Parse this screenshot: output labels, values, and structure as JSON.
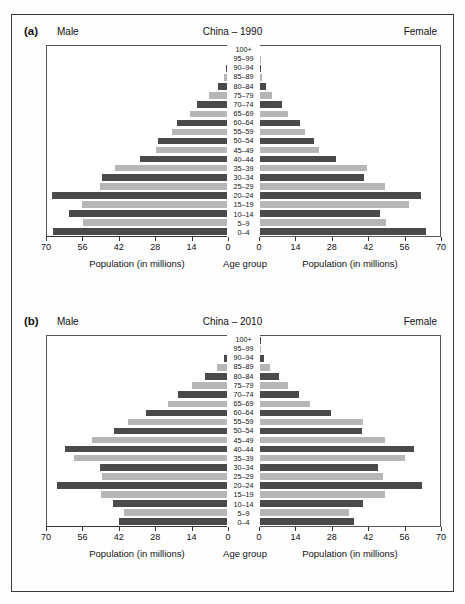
{
  "figure": {
    "panels": [
      {
        "tag": "(a)",
        "title": "China – 1990",
        "male_header": "Male",
        "female_header": "Female",
        "left_axis_title": "Population (in millions)",
        "center_axis_title": "Age group",
        "right_axis_title": "Population (in millions)"
      },
      {
        "tag": "(b)",
        "title": "China – 2010",
        "male_header": "Male",
        "female_header": "Female",
        "left_axis_title": "Population (in millions)",
        "center_axis_title": "Age group",
        "right_axis_title": "Population (in millions)"
      }
    ]
  },
  "colors": {
    "bar_dark": "#4a4a4a",
    "bar_light": "#b6b6b6",
    "frame": "#3a3a3a",
    "text": "#111111"
  },
  "chart_data": [
    {
      "type": "bar",
      "title": "China – 1990",
      "subtitle": "(a)",
      "orientation": "horizontal",
      "layout": "population-pyramid",
      "xlabel": "Population (in millions)",
      "ylabel": "Age group",
      "left_label": "Male",
      "right_label": "Female",
      "xlim": [
        0,
        70
      ],
      "xticks": [
        0,
        14,
        28,
        42,
        56,
        70
      ],
      "left_xticks_order": [
        70,
        56,
        42,
        28,
        14,
        0
      ],
      "right_xticks_order": [
        0,
        14,
        28,
        42,
        56,
        70
      ],
      "grid": false,
      "legend": "none",
      "categories": [
        "0–4",
        "5–9",
        "10–14",
        "15–19",
        "20–24",
        "25–29",
        "30–34",
        "35–39",
        "40–44",
        "45–49",
        "50–54",
        "55–59",
        "60–64",
        "65–69",
        "70–74",
        "75–79",
        "80–84",
        "85–89",
        "90–94",
        "95–99",
        "100+"
      ],
      "series": [
        {
          "name": "Male",
          "side": "left",
          "values": [
            67.5,
            56.0,
            61.5,
            56.5,
            68.0,
            49.5,
            48.5,
            43.5,
            34.0,
            27.5,
            27.0,
            21.5,
            19.5,
            14.5,
            11.5,
            7.0,
            3.5,
            1.0,
            0.3,
            0.05,
            0.0
          ]
        },
        {
          "name": "Female",
          "side": "right",
          "values": [
            64.5,
            49.0,
            46.5,
            58.0,
            62.5,
            48.5,
            40.5,
            41.5,
            29.5,
            23.0,
            21.0,
            17.5,
            15.5,
            11.0,
            8.5,
            4.5,
            2.5,
            0.8,
            0.2,
            0.05,
            0.0
          ]
        }
      ]
    },
    {
      "type": "bar",
      "title": "China – 2010",
      "subtitle": "(b)",
      "orientation": "horizontal",
      "layout": "population-pyramid",
      "xlabel": "Population (in millions)",
      "ylabel": "Age group",
      "left_label": "Male",
      "right_label": "Female",
      "xlim": [
        0,
        70
      ],
      "xticks": [
        0,
        14,
        28,
        42,
        56,
        70
      ],
      "left_xticks_order": [
        70,
        56,
        42,
        28,
        14,
        0
      ],
      "right_xticks_order": [
        0,
        14,
        28,
        42,
        56,
        70
      ],
      "grid": false,
      "legend": "none",
      "categories": [
        "0–4",
        "5–9",
        "10–14",
        "15–19",
        "20–24",
        "25–29",
        "30–34",
        "35–39",
        "40–44",
        "45–49",
        "50–54",
        "55–59",
        "60–64",
        "65–69",
        "70–74",
        "75–79",
        "80–84",
        "85–89",
        "90–94",
        "95–99",
        "100+"
      ],
      "series": [
        {
          "name": "Male",
          "side": "left",
          "values": [
            42.0,
            40.0,
            44.5,
            49.0,
            66.0,
            48.5,
            49.5,
            59.5,
            63.0,
            52.5,
            44.0,
            38.5,
            31.5,
            23.0,
            19.0,
            13.5,
            8.5,
            4.0,
            1.2,
            0.2,
            0.05
          ]
        },
        {
          "name": "Female",
          "side": "right",
          "values": [
            36.5,
            34.5,
            40.0,
            48.5,
            63.0,
            48.0,
            46.0,
            56.5,
            60.0,
            48.5,
            39.5,
            40.0,
            27.5,
            19.5,
            15.0,
            11.0,
            7.5,
            4.0,
            1.5,
            0.3,
            0.05
          ]
        }
      ]
    }
  ]
}
